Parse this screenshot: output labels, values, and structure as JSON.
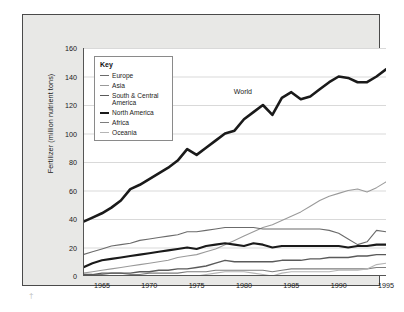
{
  "figure": {
    "background_color": "#ffffff",
    "panel_color": "#e8e8e6",
    "panel_border_color": "#4a4a4a",
    "plot_background": "#ffffff",
    "gridline_color": "#d9d9d9",
    "axis_color": "#555555",
    "corner_mark": "†"
  },
  "legend": {
    "title": "Key",
    "items": [
      {
        "label": "Europe",
        "color": "#6b6b6b",
        "width": 1.1
      },
      {
        "label": "Asia",
        "color": "#9a9a9a",
        "width": 1.1
      },
      {
        "label": "South & Central America",
        "color": "#5a5a5a",
        "width": 1.4
      },
      {
        "label": "North America",
        "color": "#1a1a1a",
        "width": 2.1
      },
      {
        "label": "Africa",
        "color": "#7d7d7d",
        "width": 1.1
      },
      {
        "label": "Oceania",
        "color": "#b5b5b5",
        "width": 1.1
      }
    ]
  },
  "annotations": [
    {
      "text": "World",
      "x": 1980.2,
      "y": 128.5
    }
  ],
  "chart_data": {
    "type": "line",
    "title": "",
    "subtitle": "",
    "xlabel": "",
    "ylabel": "Fertilizer (million nutrient tons)",
    "xlim": [
      1963,
      1995
    ],
    "ylim": [
      0,
      160
    ],
    "yticks": [
      0,
      20,
      40,
      60,
      80,
      100,
      120,
      140,
      160
    ],
    "ytick_labels": [
      "0",
      "20",
      "40",
      "60",
      "80",
      "100",
      "120",
      "140",
      "160"
    ],
    "xticks": [
      1965,
      1970,
      1975,
      1980,
      1985,
      1990,
      1995
    ],
    "xtick_labels": [
      "1965",
      "1970",
      "1975",
      "1980",
      "1985",
      "1990",
      "1995"
    ],
    "grid": "horizontal",
    "legend_position": "top-left inside",
    "x": [
      1963,
      1964,
      1965,
      1966,
      1967,
      1968,
      1969,
      1970,
      1971,
      1972,
      1973,
      1974,
      1975,
      1976,
      1977,
      1978,
      1979,
      1980,
      1981,
      1982,
      1983,
      1984,
      1985,
      1986,
      1987,
      1988,
      1989,
      1990,
      1991,
      1992,
      1993,
      1994,
      1995
    ],
    "series": [
      {
        "name": "World",
        "color": "#1a1a1a",
        "width": 2.6,
        "labelled_on_plot": true,
        "values": [
          38,
          41,
          44,
          48,
          53,
          61,
          64,
          68,
          72,
          76,
          81,
          89,
          85,
          90,
          95,
          100,
          102,
          110,
          115,
          120,
          113,
          125,
          129,
          124,
          126,
          131,
          136,
          140,
          139,
          136,
          136,
          140,
          145
        ]
      },
      {
        "name": "Asia",
        "color": "#9a9a9a",
        "width": 1.1,
        "values": [
          2,
          3,
          4,
          5,
          6,
          7,
          8,
          9,
          10,
          11,
          13,
          14,
          15,
          17,
          19,
          22,
          25,
          28,
          31,
          34,
          36,
          39,
          42,
          45,
          49,
          53,
          56,
          58,
          60,
          61,
          59,
          62,
          66
        ]
      },
      {
        "name": "Europe",
        "color": "#6b6b6b",
        "width": 1.1,
        "values": [
          15,
          17,
          19,
          21,
          22,
          23,
          25,
          26,
          27,
          28,
          29,
          31,
          31,
          32,
          33,
          34,
          34,
          34,
          34,
          33,
          33,
          33,
          33,
          33,
          33,
          33,
          32,
          30,
          26,
          22,
          24,
          32,
          31
        ]
      },
      {
        "name": "North America",
        "color": "#1a1a1a",
        "width": 2.1,
        "values": [
          6,
          9,
          11,
          12,
          13,
          14,
          15,
          16,
          17,
          18,
          19,
          20,
          19,
          21,
          22,
          23,
          22,
          21,
          23,
          22,
          20,
          21,
          21,
          21,
          21,
          21,
          21,
          21,
          20,
          21,
          21,
          22,
          22
        ]
      },
      {
        "name": "South & Central America",
        "color": "#5a5a5a",
        "width": 1.4,
        "values": [
          1,
          1,
          2,
          2,
          2,
          2,
          3,
          3,
          4,
          4,
          5,
          5,
          6,
          7,
          9,
          11,
          10,
          10,
          10,
          10,
          10,
          11,
          11,
          11,
          12,
          12,
          13,
          13,
          13,
          14,
          14,
          15,
          15
        ]
      },
      {
        "name": "Africa",
        "color": "#7d7d7d",
        "width": 1.1,
        "values": [
          1,
          1,
          1,
          2,
          2,
          1,
          1,
          2,
          2,
          2,
          2,
          3,
          3,
          3,
          4,
          4,
          4,
          4,
          4,
          4,
          3,
          4,
          5,
          5,
          5,
          5,
          5,
          5,
          5,
          5,
          5,
          6,
          6
        ]
      },
      {
        "name": "Oceania",
        "color": "#b5b5b5",
        "width": 1.1,
        "values": [
          0,
          0,
          0,
          0,
          0,
          0,
          0,
          0,
          0,
          0,
          0,
          0,
          0,
          1,
          2,
          3,
          3,
          3,
          2,
          1,
          0,
          2,
          3,
          3,
          3,
          3,
          3,
          4,
          4,
          4,
          5,
          8,
          9
        ]
      }
    ]
  }
}
